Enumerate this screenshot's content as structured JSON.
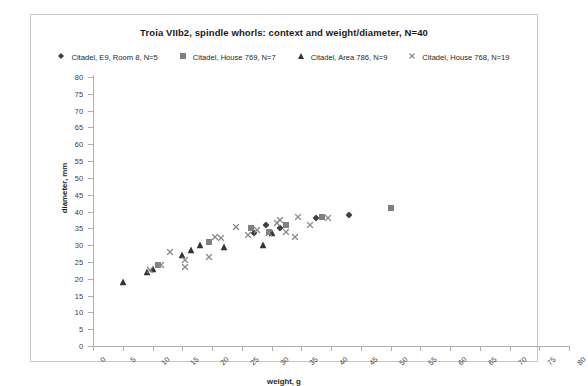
{
  "chart_data": {
    "type": "scatter",
    "title": "Troia VIIb2, spindle whorls:  context and weight/diameter, N=40",
    "xlabel": "weight, g",
    "ylabel": "diameter, mm",
    "xlim": [
      0,
      80
    ],
    "ylim": [
      0,
      80
    ],
    "xticks": [
      0,
      5,
      10,
      15,
      20,
      25,
      30,
      35,
      40,
      45,
      50,
      55,
      60,
      65,
      70,
      75,
      80
    ],
    "yticks": [
      0,
      5,
      10,
      15,
      20,
      25,
      30,
      35,
      40,
      45,
      50,
      55,
      60,
      65,
      70,
      75,
      80
    ],
    "grid": false,
    "legend_position": "top",
    "series": [
      {
        "name": "Citadel, E9, Room 8, N=5",
        "marker": "diamond",
        "color": "#404040",
        "points": [
          {
            "x": 27.0,
            "y": 33.5
          },
          {
            "x": 29.0,
            "y": 36.0
          },
          {
            "x": 31.5,
            "y": 35.0
          },
          {
            "x": 37.5,
            "y": 38.0
          },
          {
            "x": 43.0,
            "y": 39.0
          }
        ]
      },
      {
        "name": "Citadel, House 769, N=7",
        "marker": "square",
        "color": "#808080",
        "points": [
          {
            "x": 11.0,
            "y": 24.0
          },
          {
            "x": 19.5,
            "y": 31.0
          },
          {
            "x": 26.5,
            "y": 35.0
          },
          {
            "x": 29.5,
            "y": 34.0
          },
          {
            "x": 32.5,
            "y": 36.0
          },
          {
            "x": 38.5,
            "y": 38.5
          },
          {
            "x": 50.0,
            "y": 41.0
          }
        ]
      },
      {
        "name": "Citadel, Area 786, N=9",
        "marker": "triangle",
        "color": "#333333",
        "points": [
          {
            "x": 5.0,
            "y": 19.0
          },
          {
            "x": 9.0,
            "y": 22.0
          },
          {
            "x": 10.0,
            "y": 23.0
          },
          {
            "x": 15.0,
            "y": 27.0
          },
          {
            "x": 16.5,
            "y": 28.5
          },
          {
            "x": 18.0,
            "y": 30.0
          },
          {
            "x": 22.0,
            "y": 29.5
          },
          {
            "x": 28.5,
            "y": 30.0
          },
          {
            "x": 30.0,
            "y": 33.5
          }
        ]
      },
      {
        "name": "Citadel, House 768, N=19",
        "marker": "cross",
        "color": "#8a8a8a",
        "points": [
          {
            "x": 9.5,
            "y": 22.5
          },
          {
            "x": 11.5,
            "y": 24.0
          },
          {
            "x": 13.0,
            "y": 28.0
          },
          {
            "x": 15.5,
            "y": 25.5
          },
          {
            "x": 15.5,
            "y": 23.5
          },
          {
            "x": 19.5,
            "y": 26.5
          },
          {
            "x": 20.5,
            "y": 32.5
          },
          {
            "x": 21.5,
            "y": 32.0
          },
          {
            "x": 24.0,
            "y": 35.5
          },
          {
            "x": 26.0,
            "y": 33.0
          },
          {
            "x": 27.5,
            "y": 34.5
          },
          {
            "x": 29.5,
            "y": 33.5
          },
          {
            "x": 31.0,
            "y": 36.5
          },
          {
            "x": 31.5,
            "y": 37.5
          },
          {
            "x": 32.5,
            "y": 34.0
          },
          {
            "x": 34.0,
            "y": 32.5
          },
          {
            "x": 34.5,
            "y": 38.5
          },
          {
            "x": 36.5,
            "y": 36.0
          },
          {
            "x": 39.5,
            "y": 38.0
          }
        ]
      }
    ]
  }
}
